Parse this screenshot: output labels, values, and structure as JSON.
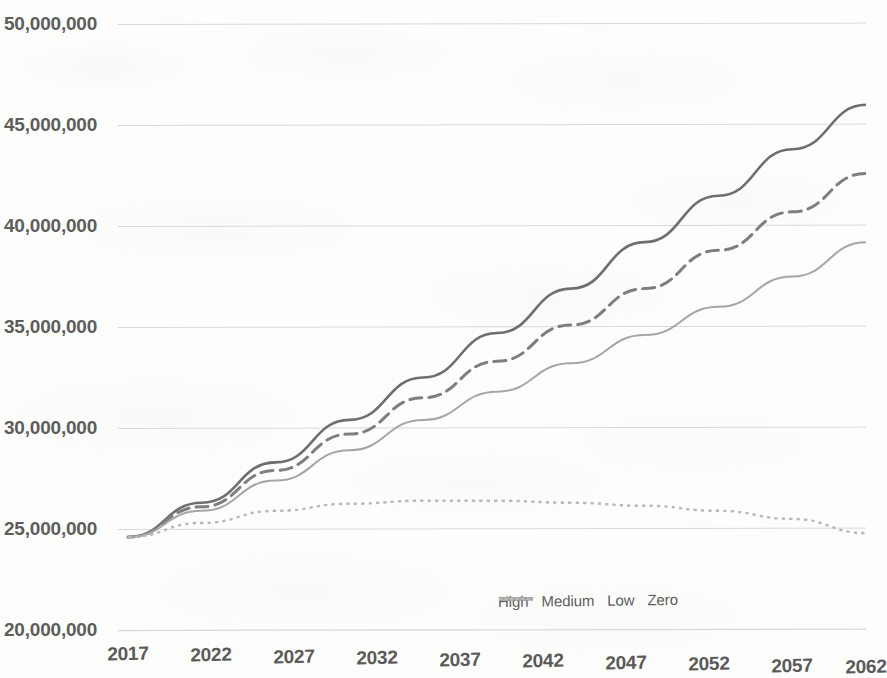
{
  "chart_data": {
    "type": "line",
    "title": "",
    "subtitle": "",
    "xlabel": "",
    "ylabel": "",
    "x": [
      2017,
      2022,
      2027,
      2032,
      2037,
      2042,
      2047,
      2052,
      2057,
      2062,
      2067
    ],
    "x_tick_labels": [
      "2017",
      "2022",
      "2027",
      "2032",
      "2037",
      "2042",
      "2047",
      "2052",
      "2057",
      "2062"
    ],
    "y_tick_labels": [
      "20,000,000",
      "25,000,000",
      "30,000,000",
      "35,000,000",
      "40,000,000",
      "45,000,000",
      "50,000,000"
    ],
    "y_ticks": [
      20000000,
      25000000,
      30000000,
      35000000,
      40000000,
      45000000,
      50000000
    ],
    "ylim": [
      20000000,
      50000000
    ],
    "xlim": [
      2017,
      2067
    ],
    "grid": true,
    "grid_axis": "y",
    "legend_position": "bottom-right",
    "series": [
      {
        "name": "High",
        "style": "solid",
        "color": "#6e6e6c",
        "width": 2.6,
        "values": [
          24600000,
          26300000,
          28300000,
          30400000,
          32500000,
          34700000,
          36900000,
          39200000,
          41500000,
          43800000,
          46000000
        ]
      },
      {
        "name": "Medium",
        "style": "dashed",
        "color": "#7e7e7c",
        "width": 3.0,
        "values": [
          24600000,
          26100000,
          27900000,
          29700000,
          31500000,
          33300000,
          35100000,
          36900000,
          38800000,
          40700000,
          42600000
        ]
      },
      {
        "name": "Low",
        "style": "solid",
        "color": "#a6a6a4",
        "width": 2.0,
        "values": [
          24600000,
          25900000,
          27400000,
          28900000,
          30400000,
          31800000,
          33200000,
          34600000,
          36000000,
          37500000,
          39200000
        ]
      },
      {
        "name": "Zero",
        "style": "dotted",
        "color": "#b8b8b6",
        "width": 2.4,
        "values": [
          24600000,
          25300000,
          25900000,
          26250000,
          26400000,
          26400000,
          26300000,
          26150000,
          25900000,
          25500000,
          24800000
        ]
      }
    ]
  },
  "legend": {
    "items": [
      {
        "label": "High",
        "style": "solid",
        "color": "#6e6e6c"
      },
      {
        "label": "Medium",
        "style": "dashed",
        "color": "#7e7e7c"
      },
      {
        "label": "Low",
        "style": "solid",
        "color": "#a6a6a4"
      },
      {
        "label": "Zero",
        "style": "dotted",
        "color": "#bcbcba"
      }
    ]
  },
  "axes": {
    "y_labels": [
      {
        "text": "50,000,000",
        "y": 24
      },
      {
        "text": "45,000,000",
        "y": 125
      },
      {
        "text": "40,000,000",
        "y": 226
      },
      {
        "text": "35,000,000",
        "y": 327
      },
      {
        "text": "30,000,000",
        "y": 428
      },
      {
        "text": "25,000,000",
        "y": 529
      },
      {
        "text": "20,000,000",
        "y": 630
      }
    ],
    "x_labels": [
      {
        "text": "2017",
        "x": 128
      },
      {
        "text": "2022",
        "x": 211
      },
      {
        "text": "2027",
        "x": 294
      },
      {
        "text": "2032",
        "x": 377
      },
      {
        "text": "2037",
        "x": 460
      },
      {
        "text": "2042",
        "x": 543
      },
      {
        "text": "2047",
        "x": 626
      },
      {
        "text": "2052",
        "x": 709
      },
      {
        "text": "2057",
        "x": 792
      },
      {
        "text": "2062",
        "x": 866
      }
    ],
    "gridline_color": "#d9d9d7",
    "axis_color": "#c9c9c7"
  }
}
